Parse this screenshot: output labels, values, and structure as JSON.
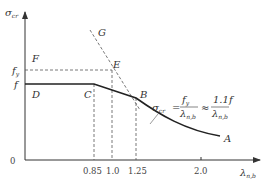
{
  "diagram": {
    "y_axis_label": "σ",
    "y_axis_label_sub": "cr",
    "x_axis_label": "λ",
    "x_axis_label_sub": "n,b",
    "origin_label": "0",
    "y_ticks": [
      {
        "label": "f",
        "sub": "y"
      },
      {
        "label": "f",
        "sub": ""
      }
    ],
    "x_ticks": [
      "0.85",
      "1.0",
      "1.25",
      "2.0"
    ],
    "points": {
      "F": "F",
      "G": "G",
      "E": "E",
      "D": "D",
      "C": "C",
      "B": "B",
      "A": "A"
    },
    "formula": {
      "lhs": "σ",
      "lhs_sub": "cr",
      "eq": "=",
      "num1": "f",
      "num1_sub": "y",
      "den1": "λ",
      "den1_sup": "2",
      "den1_sub": "n,b",
      "approx": "≈",
      "num2": "1.1f",
      "den2": "λ",
      "den2_sup": "2",
      "den2_sub": "n,b"
    }
  }
}
